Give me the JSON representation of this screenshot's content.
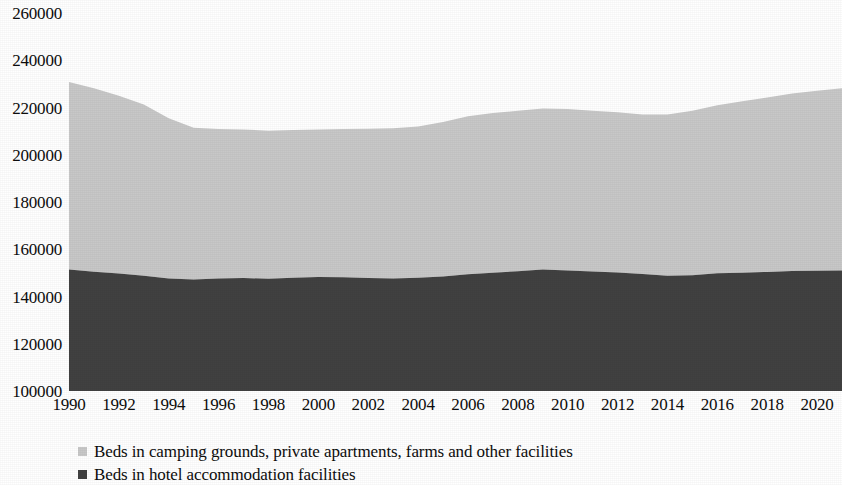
{
  "chart_data": {
    "type": "area",
    "stacked": true,
    "title": "",
    "subtitle": "",
    "xlabel": "",
    "ylabel": "",
    "grid": false,
    "legend_position": "bottom-left",
    "xlim": [
      1990,
      2021
    ],
    "ylim": [
      100000,
      260000
    ],
    "y_ticks": [
      260000,
      240000,
      220000,
      200000,
      180000,
      160000,
      140000,
      120000,
      100000
    ],
    "x_ticks": [
      1990,
      1992,
      1994,
      1996,
      1998,
      2000,
      2002,
      2004,
      2006,
      2008,
      2010,
      2012,
      2014,
      2016,
      2018,
      2020
    ],
    "x": [
      1990,
      1991,
      1992,
      1993,
      1994,
      1995,
      1996,
      1997,
      1998,
      1999,
      2000,
      2001,
      2002,
      2003,
      2004,
      2005,
      2006,
      2007,
      2008,
      2009,
      2010,
      2011,
      2012,
      2013,
      2014,
      2015,
      2016,
      2017,
      2018,
      2019,
      2020,
      2021
    ],
    "series": [
      {
        "name": "Beds in hotel accommodation facilities",
        "color": "#414141",
        "values": [
          151400,
          150500,
          149700,
          148800,
          147600,
          147200,
          147600,
          147800,
          147500,
          147900,
          148300,
          148100,
          147800,
          147600,
          147900,
          148500,
          149400,
          150100,
          150700,
          151400,
          151000,
          150600,
          150200,
          149500,
          148800,
          149000,
          149800,
          150100,
          150400,
          150800,
          150900,
          151000
        ]
      },
      {
        "name": "Beds in camping grounds, private apartments, farms and other facilities",
        "color": "#c8c8c8",
        "values": [
          79400,
          77600,
          75300,
          72500,
          67800,
          64200,
          63300,
          62900,
          62700,
          62600,
          62400,
          62800,
          63200,
          63600,
          64100,
          65400,
          66900,
          67600,
          67900,
          68200,
          68400,
          68000,
          67800,
          67500,
          68200,
          69600,
          71200,
          72500,
          73800,
          75100,
          76200,
          77100
        ]
      }
    ],
    "totals": [
      230800,
      228100,
      225000,
      221300,
      215400,
      211400,
      210900,
      210700,
      210200,
      210500,
      210700,
      210900,
      211000,
      211200,
      212000,
      213900,
      216300,
      217700,
      218600,
      219600,
      219400,
      218600,
      218000,
      217000,
      217000,
      218600,
      221000,
      222600,
      224200,
      225900,
      227100,
      228100
    ]
  },
  "legend": {
    "items": [
      {
        "label": "Beds in camping grounds, private apartments, farms and other facilities",
        "color": "#c8c8c8"
      },
      {
        "label": "Beds in hotel accommodation facilities",
        "color": "#414141"
      }
    ]
  },
  "colors": {
    "light_series": "#c8c8c8",
    "dark_series": "#414141",
    "text": "#0d0d0d",
    "background": "#ffffff"
  }
}
